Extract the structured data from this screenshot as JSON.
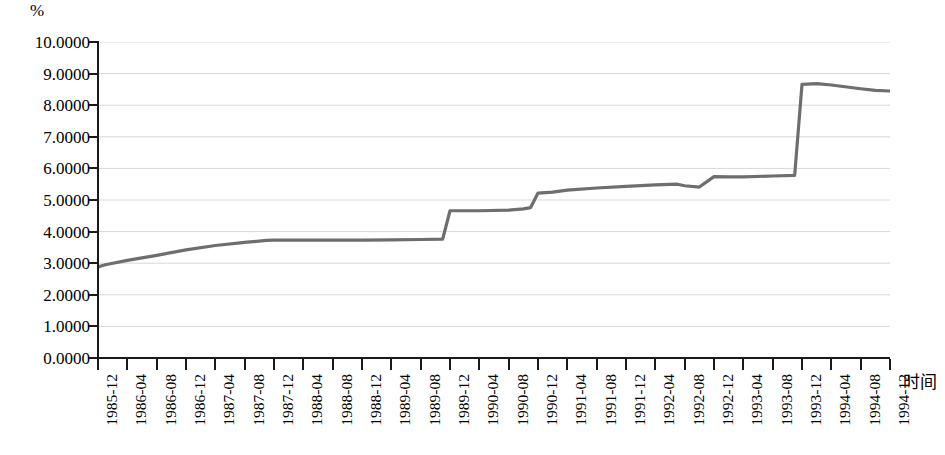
{
  "chart_data": {
    "type": "line",
    "title": "",
    "subtitle": "",
    "xlabel": "时间",
    "ylabel": "%",
    "ylim": [
      0,
      10
    ],
    "ytick_labels": [
      "10.0000",
      "9.0000",
      "8.0000",
      "7.0000",
      "6.0000",
      "5.0000",
      "4.0000",
      "3.0000",
      "2.0000",
      "1.0000",
      "0.0000"
    ],
    "ytick_values": [
      10,
      9,
      8,
      7,
      6,
      5,
      4,
      3,
      2,
      1,
      0
    ],
    "grid": "horizontal",
    "legend": "none",
    "line_color": "#6e6e6e",
    "categories": [
      "1985-12",
      "1986-04",
      "1986-08",
      "1986-12",
      "1987-04",
      "1987-08",
      "1987-12",
      "1988-04",
      "1988-08",
      "1988-12",
      "1989-04",
      "1989-08",
      "1989-12",
      "1990-04",
      "1990-08",
      "1990-12",
      "1991-04",
      "1991-08",
      "1991-12",
      "1992-04",
      "1992-08",
      "1992-12",
      "1993-04",
      "1993-08",
      "1993-12",
      "1994-04",
      "1994-08",
      "1994-12"
    ],
    "series": [
      {
        "name": "利率",
        "points": [
          {
            "x": "1985-12",
            "y": 2.88
          },
          {
            "x": "1986-01",
            "y": 2.95
          },
          {
            "x": "1986-04",
            "y": 3.09
          },
          {
            "x": "1986-08",
            "y": 3.25
          },
          {
            "x": "1986-12",
            "y": 3.42
          },
          {
            "x": "1987-04",
            "y": 3.56
          },
          {
            "x": "1987-08",
            "y": 3.66
          },
          {
            "x": "1987-11",
            "y": 3.72
          },
          {
            "x": "1987-12",
            "y": 3.73
          },
          {
            "x": "1988-04",
            "y": 3.73
          },
          {
            "x": "1988-08",
            "y": 3.73
          },
          {
            "x": "1988-12",
            "y": 3.73
          },
          {
            "x": "1989-04",
            "y": 3.74
          },
          {
            "x": "1989-08",
            "y": 3.75
          },
          {
            "x": "1989-11",
            "y": 3.76
          },
          {
            "x": "1989-12",
            "y": 4.66
          },
          {
            "x": "1990-04",
            "y": 4.66
          },
          {
            "x": "1990-08",
            "y": 4.68
          },
          {
            "x": "1990-10",
            "y": 4.72
          },
          {
            "x": "1990-11",
            "y": 4.76
          },
          {
            "x": "1990-12",
            "y": 5.22
          },
          {
            "x": "1991-02",
            "y": 5.25
          },
          {
            "x": "1991-04",
            "y": 5.31
          },
          {
            "x": "1991-08",
            "y": 5.38
          },
          {
            "x": "1991-12",
            "y": 5.43
          },
          {
            "x": "1992-04",
            "y": 5.48
          },
          {
            "x": "1992-07",
            "y": 5.5
          },
          {
            "x": "1992-08",
            "y": 5.45
          },
          {
            "x": "1992-10",
            "y": 5.41
          },
          {
            "x": "1992-12",
            "y": 5.74
          },
          {
            "x": "1993-02",
            "y": 5.73
          },
          {
            "x": "1993-04",
            "y": 5.73
          },
          {
            "x": "1993-08",
            "y": 5.76
          },
          {
            "x": "1993-11",
            "y": 5.78
          },
          {
            "x": "1993-12",
            "y": 8.66
          },
          {
            "x": "1994-02",
            "y": 8.68
          },
          {
            "x": "1994-04",
            "y": 8.64
          },
          {
            "x": "1994-08",
            "y": 8.52
          },
          {
            "x": "1994-10",
            "y": 8.47
          },
          {
            "x": "1994-12",
            "y": 8.45
          }
        ]
      }
    ]
  }
}
